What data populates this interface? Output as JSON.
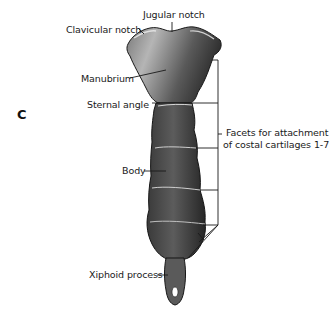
{
  "figure": {
    "panel_letter": "C",
    "labels": {
      "jugular_notch": "Jugular notch",
      "clavicular_notch": "Clavicular notch",
      "manubrium": "Manubrium",
      "sternal_angle": "Sternal angle",
      "body": "Body",
      "xiphoid_process": "Xiphoid process",
      "facets_line1": "Facets for attachment",
      "facets_line2": "of costal cartilages 1-7"
    },
    "colors": {
      "background": "#ffffff",
      "bone_light": "#9a9a9a",
      "bone_dark": "#2a2a2a",
      "lines": "#1a1a1a"
    }
  }
}
